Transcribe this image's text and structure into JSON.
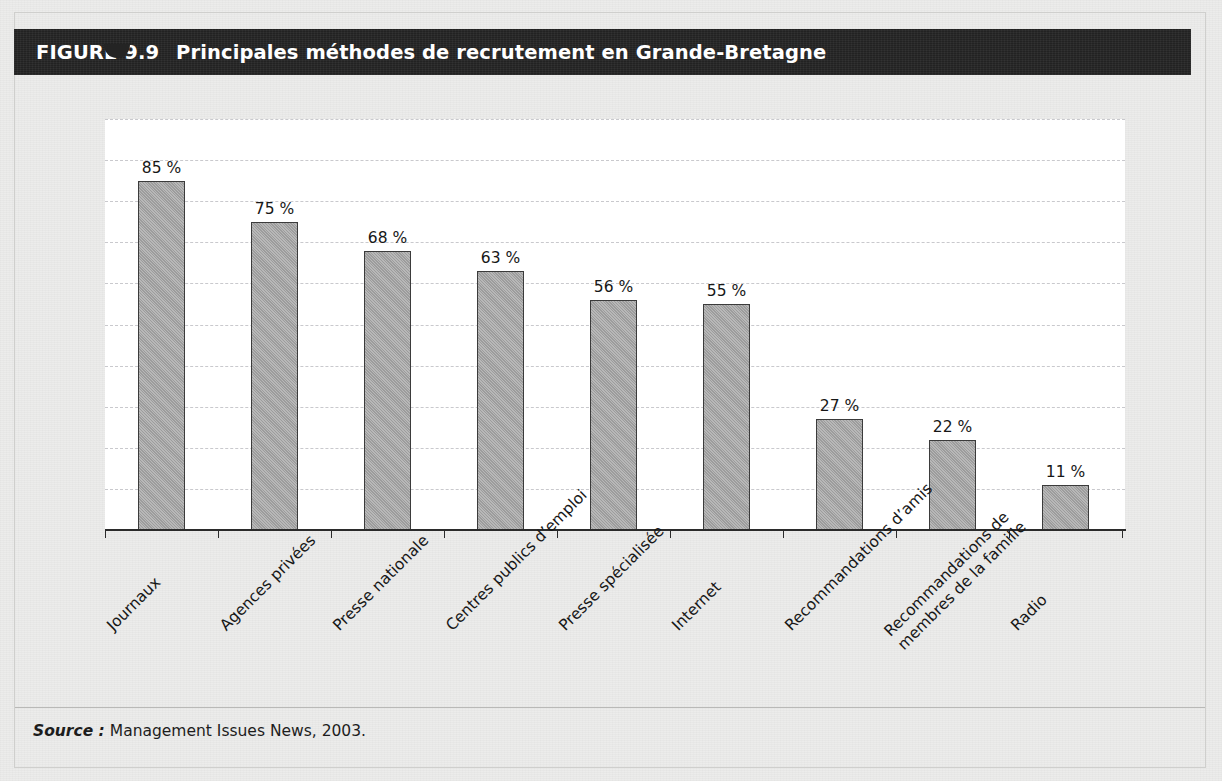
{
  "figure": {
    "label": "FIGURE 9.9",
    "title": "Principales méthodes de recrutement en Grande-Bretagne"
  },
  "source": {
    "label": "Source :",
    "text": "Management Issues News, 2003."
  },
  "colors": {
    "title_bar": "#242424",
    "page_background": "#ececeb",
    "plot_background": "#ffffff",
    "bar_fill": "#a6a6a6",
    "bar_border": "#3b3b3b",
    "gridline": "#c9c9cd",
    "axis": "#2b2b2b"
  },
  "chart_data": {
    "type": "bar",
    "title": "Principales méthodes de recrutement en Grande-Bretagne",
    "xlabel": "",
    "ylabel": "",
    "ylim": [
      0,
      100
    ],
    "grid": "horizontal-dashed",
    "legend": "none",
    "orientation": "vertical",
    "value_suffix": " %",
    "categories": [
      "Journaux",
      "Agences privées",
      "Presse nationale",
      "Centres publics d’emploi",
      "Presse spécialisée",
      "Internet",
      "Recommandations d’amis",
      "Recommandations de membres de la famille",
      "Radio"
    ],
    "category_lines": [
      [
        "Journaux"
      ],
      [
        "Agences privées"
      ],
      [
        "Presse nationale"
      ],
      [
        "Centres publics d’emploi"
      ],
      [
        "Presse spécialisée"
      ],
      [
        "Internet"
      ],
      [
        "Recommandations d’amis"
      ],
      [
        "Recommandations de",
        "membres de la famille"
      ],
      [
        "Radio"
      ]
    ],
    "values": [
      85,
      75,
      68,
      63,
      56,
      55,
      27,
      22,
      11
    ],
    "labels": [
      "85 %",
      "75 %",
      "68 %",
      "63 %",
      "56 %",
      "55 %",
      "27 %",
      "22 %",
      "11 %"
    ]
  }
}
